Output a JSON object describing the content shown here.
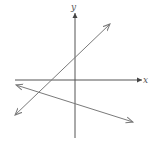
{
  "diagram": {
    "type": "coordinate-plane-two-lines",
    "axes": {
      "x_label": "x",
      "y_label": "y"
    },
    "colors": {
      "axis": "#555555",
      "line": "#7a7a7a"
    },
    "lines": [
      {
        "name": "line-positive-slope",
        "from": [
          15,
          115
        ],
        "to": [
          110,
          24
        ],
        "arrows": "both"
      },
      {
        "name": "line-negative-slope",
        "from": [
          16,
          85
        ],
        "to": [
          133,
          122
        ],
        "arrows": "both"
      }
    ]
  }
}
